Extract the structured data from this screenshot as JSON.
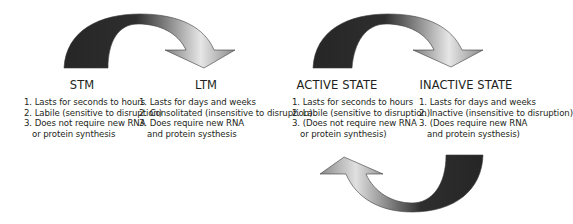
{
  "colors": {
    "arrow_dark": "#2b2b2b",
    "arrow_light": "#e8e8e8",
    "arrow_mid": "#7a7a7a",
    "text": "#231f20",
    "background": "#ffffff"
  },
  "panels": {
    "memory": {
      "left": {
        "title": "STM",
        "items": [
          "1. Lasts for seconds to hours",
          "2. Labile (sensitive to disruption)",
          "3. Does not require new RNA",
          "or protein synthesis"
        ]
      },
      "right": {
        "title": "LTM",
        "items": [
          "1. Lasts for days and weeks",
          "2. Consolitated (insensitive to disruption)",
          "3. Does require new RNA",
          "and protein systhesis"
        ]
      }
    },
    "state": {
      "left": {
        "title": "ACTIVE STATE",
        "items": [
          "1. Lasts for seconds to hours",
          "2. Labile (sensitive to disruption)",
          "3. (Does not require new RNA",
          "or protein synthesis)"
        ]
      },
      "right": {
        "title": "INACTIVE STATE",
        "items": [
          "1. Lasts for days and weeks",
          "2. Inactive (insensitive to disruption)",
          "3. (Does require new RNA",
          "and protein systhesis)"
        ]
      }
    }
  },
  "arrows": [
    {
      "name": "stm-to-ltm-arrow",
      "direction": "forward"
    },
    {
      "name": "active-to-inactive-arrow",
      "direction": "forward"
    },
    {
      "name": "inactive-to-active-arrow",
      "direction": "return"
    }
  ]
}
